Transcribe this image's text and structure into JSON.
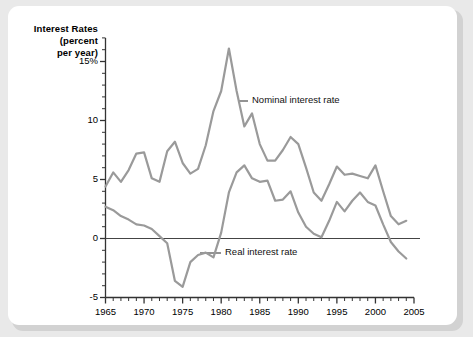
{
  "figure": {
    "background_color": "#e9e9e9",
    "panel_color": "#ffffff",
    "line_color": "#9a9a9a",
    "axis_color": "#333333"
  },
  "title": {
    "line1": "Interest Rates",
    "line2": "(percent",
    "line3": "per year)"
  },
  "chart_data": {
    "type": "line",
    "title": "Interest Rates (percent per year)",
    "xlabel": "",
    "ylabel": "Interest Rates (percent per year)",
    "xlim": [
      1965,
      2005
    ],
    "ylim": [
      -5,
      17
    ],
    "grid": false,
    "legend_position": "inline-annotations",
    "y_ticks": [
      -5,
      0,
      5,
      10,
      15
    ],
    "y_tick_labels": [
      "-5",
      "0",
      "5",
      "10",
      "15%"
    ],
    "y_minor_step": 1,
    "x_ticks": [
      1965,
      1970,
      1975,
      1980,
      1985,
      1990,
      1995,
      2000,
      2005
    ],
    "x_tick_labels": [
      "1965",
      "1970",
      "1975",
      "1980",
      "1985",
      "1990",
      "1995",
      "2000",
      "2005"
    ],
    "x_minor_step": 1,
    "zero_line": 0,
    "x": [
      1965,
      1966,
      1967,
      1968,
      1969,
      1970,
      1971,
      1972,
      1973,
      1974,
      1975,
      1976,
      1977,
      1978,
      1979,
      1980,
      1981,
      1982,
      1983,
      1984,
      1985,
      1986,
      1987,
      1988,
      1989,
      1990,
      1991,
      1992,
      1993,
      1994,
      1995,
      1996,
      1997,
      1998,
      1999,
      2000,
      2001,
      2002,
      2003,
      2004
    ],
    "series": [
      {
        "name": "Nominal interest rate",
        "label": "Nominal interest rate",
        "values": [
          4.4,
          5.6,
          4.8,
          5.8,
          7.2,
          7.3,
          5.1,
          4.8,
          7.4,
          8.2,
          6.4,
          5.5,
          5.9,
          7.9,
          10.8,
          12.5,
          16.1,
          12.5,
          9.5,
          10.6,
          8.0,
          6.6,
          6.6,
          7.5,
          8.6,
          8.0,
          6.0,
          3.9,
          3.2,
          4.6,
          6.1,
          5.4,
          5.5,
          5.3,
          5.1,
          6.2,
          4.0,
          1.9,
          1.2,
          1.5
        ]
      },
      {
        "name": "Real interest rate",
        "label": "Real interest rate",
        "values": [
          2.7,
          2.4,
          1.9,
          1.6,
          1.2,
          1.1,
          0.8,
          0.2,
          -0.4,
          -3.6,
          -4.1,
          -2.0,
          -1.4,
          -1.2,
          -1.6,
          0.5,
          3.9,
          5.6,
          6.2,
          5.1,
          4.8,
          4.9,
          3.2,
          3.3,
          4.0,
          2.2,
          1.0,
          0.4,
          0.1,
          1.5,
          3.1,
          2.3,
          3.2,
          3.9,
          3.1,
          2.8,
          1.2,
          -0.3,
          -1.1,
          -1.7
        ]
      }
    ],
    "annotations": [
      {
        "text": "Nominal interest rate",
        "x": 1983,
        "y": 12.0
      },
      {
        "text": "Real interest rate",
        "x": 1979,
        "y": -1.3
      }
    ]
  }
}
